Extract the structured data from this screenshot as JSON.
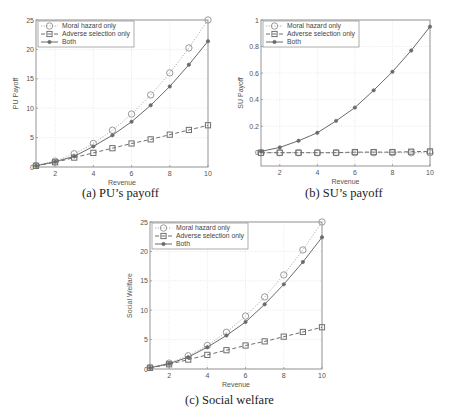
{
  "legend": {
    "moral_hazard": "Moral hazard only",
    "adverse_selection": "Adverse selection only",
    "both": "Both"
  },
  "captions": {
    "a": "(a) PU’s payoff",
    "b": "(b) SU’s payoff",
    "c": "(c) Social welfare"
  },
  "colors": {
    "axis": "#8a8a8a",
    "grid": "#d8d8d8",
    "moral_hazard": "#9a9a9a",
    "adverse_selection": "#6f6f6f",
    "both": "#6a6a6a"
  },
  "chart_data": [
    {
      "id": "a",
      "type": "line",
      "title": "(a) PU’s payoff",
      "xlabel": "Revenue",
      "ylabel": "PU Payoff",
      "xlim": [
        1,
        10
      ],
      "ylim": [
        0,
        25
      ],
      "xticks": [
        2,
        4,
        6,
        8,
        10
      ],
      "yticks": [
        0,
        5,
        10,
        15,
        20,
        25
      ],
      "grid": true,
      "legend_position": "upper left",
      "x": [
        1,
        2,
        3,
        4,
        5,
        6,
        7,
        8,
        9,
        10
      ],
      "series": [
        {
          "name": "Moral hazard only",
          "style": "dotted",
          "marker": "circle",
          "values": [
            0.25,
            1.0,
            2.25,
            4.0,
            6.25,
            9.0,
            12.25,
            16.0,
            20.25,
            25.0
          ]
        },
        {
          "name": "Adverse selection only",
          "style": "dashed",
          "marker": "square",
          "values": [
            0.2,
            0.8,
            1.6,
            2.4,
            3.2,
            4.0,
            4.7,
            5.5,
            6.3,
            7.1
          ]
        },
        {
          "name": "Both",
          "style": "solid",
          "marker": "dot",
          "values": [
            0.2,
            0.9,
            1.8,
            3.5,
            5.4,
            7.7,
            10.5,
            13.7,
            17.4,
            21.4
          ]
        }
      ]
    },
    {
      "id": "b",
      "type": "line",
      "title": "(b) SU’s payoff",
      "xlabel": "Revenue",
      "ylabel": "SU Payoff",
      "xlim": [
        1,
        10
      ],
      "ylim": [
        -0.1,
        1
      ],
      "xticks": [
        2,
        4,
        6,
        8,
        10
      ],
      "yticks": [
        0,
        0.2,
        0.4,
        0.6,
        0.8,
        1
      ],
      "grid": true,
      "legend_position": "upper left",
      "x": [
        1,
        2,
        3,
        4,
        5,
        6,
        7,
        8,
        9,
        10
      ],
      "series": [
        {
          "name": "Moral hazard only",
          "style": "dotted",
          "marker": "circle",
          "values": [
            0,
            0,
            0,
            0,
            0,
            0,
            0,
            0,
            0,
            0
          ]
        },
        {
          "name": "Adverse selection only",
          "style": "dashed",
          "marker": "square",
          "values": [
            0.0,
            0.0,
            0.0,
            0.0,
            0.0,
            0.005,
            0.005,
            0.005,
            0.008,
            0.01
          ]
        },
        {
          "name": "Both",
          "style": "solid",
          "marker": "dot",
          "values": [
            0.01,
            0.04,
            0.09,
            0.15,
            0.24,
            0.34,
            0.47,
            0.61,
            0.77,
            0.95
          ]
        }
      ]
    },
    {
      "id": "c",
      "type": "line",
      "title": "(c) Social welfare",
      "xlabel": "Revenue",
      "ylabel": "Social Welfare",
      "xlim": [
        1,
        10
      ],
      "ylim": [
        0,
        25
      ],
      "xticks": [
        2,
        4,
        6,
        8,
        10
      ],
      "yticks": [
        0,
        5,
        10,
        15,
        20,
        25
      ],
      "grid": true,
      "legend_position": "upper left",
      "x": [
        1,
        2,
        3,
        4,
        5,
        6,
        7,
        8,
        9,
        10
      ],
      "series": [
        {
          "name": "Moral hazard only",
          "style": "dotted",
          "marker": "circle",
          "values": [
            0.25,
            1.0,
            2.25,
            4.0,
            6.25,
            9.0,
            12.25,
            16.0,
            20.25,
            25.0
          ]
        },
        {
          "name": "Adverse selection only",
          "style": "dashed",
          "marker": "square",
          "values": [
            0.2,
            0.8,
            1.6,
            2.4,
            3.2,
            4.0,
            4.7,
            5.5,
            6.3,
            7.1
          ]
        },
        {
          "name": "Both",
          "style": "solid",
          "marker": "dot",
          "values": [
            0.2,
            0.9,
            2.0,
            3.7,
            5.7,
            8.0,
            11.0,
            14.4,
            18.2,
            22.4
          ]
        }
      ]
    }
  ],
  "layout": {
    "a": {
      "left": 36,
      "right": 208,
      "top": 20,
      "bottom": 167
    },
    "b": {
      "left": 261,
      "right": 430,
      "top": 20,
      "bottom": 166
    },
    "c": {
      "left": 150,
      "right": 322,
      "top": 222,
      "bottom": 369
    }
  }
}
